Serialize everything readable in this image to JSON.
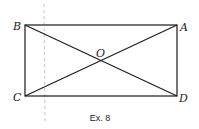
{
  "figure": {
    "caption": "Ex. 8",
    "shape": "rectangle with diagonals",
    "points": {
      "A": {
        "label": "A",
        "x": 177,
        "y": 25
      },
      "B": {
        "label": "B",
        "x": 25,
        "y": 25
      },
      "C": {
        "label": "C",
        "x": 25,
        "y": 96
      },
      "D": {
        "label": "D",
        "x": 177,
        "y": 96
      },
      "O": {
        "label": "O",
        "x": 101,
        "y": 60
      }
    },
    "segments": [
      "BA",
      "AD",
      "DC",
      "CB",
      "BD",
      "CA"
    ],
    "colors": {
      "stroke": "#1a1a1a",
      "artifact": "#b8b8b8"
    }
  }
}
